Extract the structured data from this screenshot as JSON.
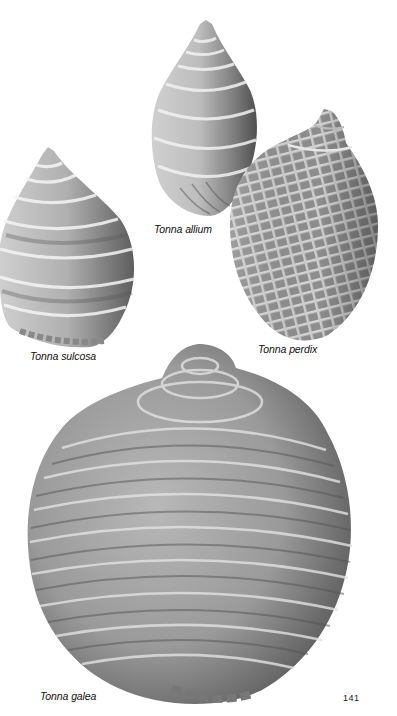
{
  "page": {
    "page_number": "141",
    "background": "#ffffff"
  },
  "shells": [
    {
      "id": "tonna-allium",
      "caption": "Tonna allium"
    },
    {
      "id": "tonna-sulcosa",
      "caption": "Tonna sulcosa"
    },
    {
      "id": "tonna-perdix",
      "caption": "Tonna perdix"
    },
    {
      "id": "tonna-galea",
      "caption": "Tonna galea"
    }
  ],
  "colors": {
    "shell_dark": "#4a4a4a",
    "shell_mid": "#8a8a8a",
    "shell_light": "#d8d8d8",
    "caption_text": "#111111"
  }
}
